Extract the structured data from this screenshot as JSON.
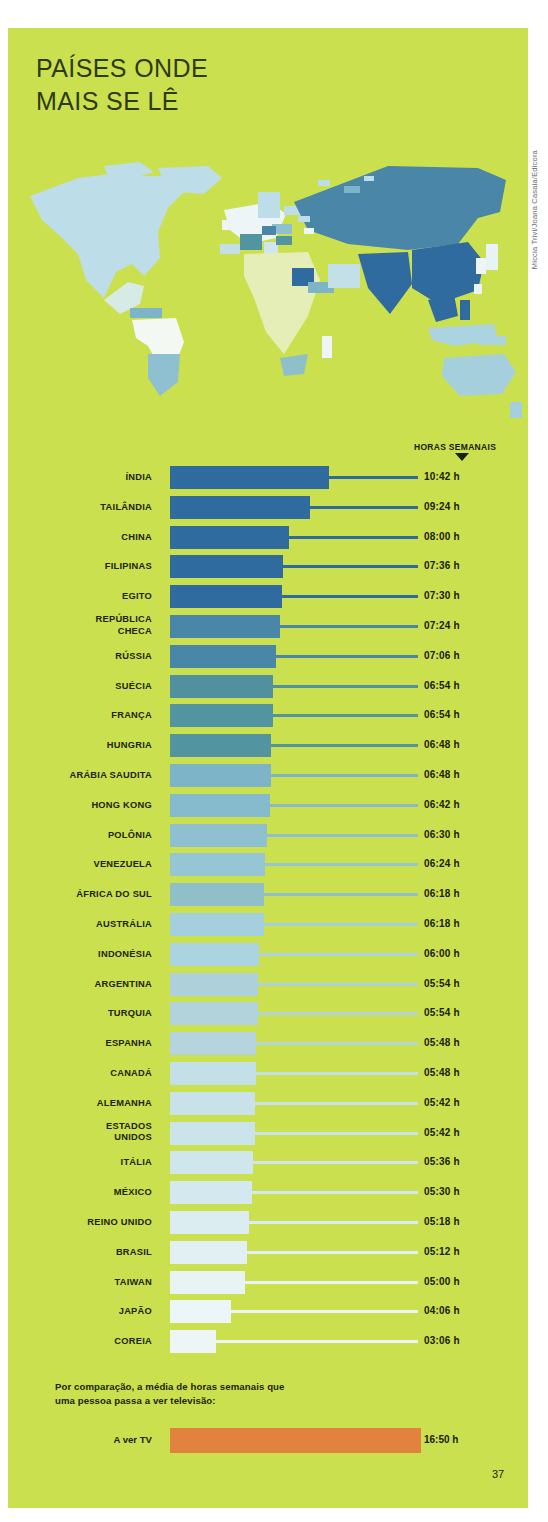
{
  "title": {
    "line1": "PAÍSES ONDE",
    "line2": "MAIS SE LÊ"
  },
  "header": {
    "column_label": "HORAS SEMANAIS",
    "marker_icon": "down-triangle-icon"
  },
  "footnote": {
    "line1": "Por comparação, a média de horas semanais que",
    "line2": "uma pessoa passa a ver televisão:"
  },
  "tv": {
    "label": "A ver TV",
    "value": "16:50 h"
  },
  "page_number": "37",
  "credit": "Miccia Trivi/Joana Casaia/Edicora",
  "colors": {
    "background": "#cbe04f",
    "text": "#1b2409",
    "tv_bar": "#e2823f",
    "darkest_bar": "#2f6b9e",
    "lightest_bar": "#eef5f6"
  },
  "chart_data": {
    "type": "bar",
    "title": "PAÍSES ONDE MAIS SE LÊ",
    "subtitle": "",
    "xlabel": "",
    "ylabel": "",
    "value_axis_label": "HORAS SEMANAIS",
    "orientation": "horizontal",
    "grid": false,
    "legend": "none",
    "unit": "h",
    "xlim": [
      0,
      11
    ],
    "categories": [
      "ÍNDIA",
      "TAILÂNDIA",
      "CHINA",
      "FILIPINAS",
      "EGITO",
      "REPÚBLICA\nCHECA",
      "RÚSSIA",
      "SUÉCIA",
      "FRANÇA",
      "HUNGRIA",
      "ARÁBIA SAUDITA",
      "HONG KONG",
      "POLÔNIA",
      "VENEZUELA",
      "ÁFRICA DO SUL",
      "AUSTRÁLIA",
      "INDONÉSIA",
      "ARGENTINA",
      "TURQUIA",
      "ESPANHA",
      "CANADÁ",
      "ALEMANHA",
      "ESTADOS\nUNIDOS",
      "ITÁLIA",
      "MÉXICO",
      "REINO UNIDO",
      "BRASIL",
      "TAIWAN",
      "JAPÃO",
      "COREIA"
    ],
    "labels": [
      "10:42 h",
      "09:24 h",
      "08:00 h",
      "07:36 h",
      "07:30 h",
      "07:24 h",
      "07:06 h",
      "06:54 h",
      "06:54 h",
      "06:48 h",
      "06:48 h",
      "06:42 h",
      "06:30 h",
      "06:24 h",
      "06:18 h",
      "06:18 h",
      "06:00 h",
      "05:54 h",
      "05:54 h",
      "05:48 h",
      "05:48 h",
      "05:42 h",
      "05:42 h",
      "05:36 h",
      "05:30 h",
      "05:18 h",
      "05:12 h",
      "05:00 h",
      "04:06 h",
      "03:06 h"
    ],
    "values": [
      10.7,
      9.4,
      8.0,
      7.6,
      7.5,
      7.4,
      7.1,
      6.9,
      6.9,
      6.8,
      6.8,
      6.7,
      6.5,
      6.4,
      6.3,
      6.3,
      6.0,
      5.9,
      5.9,
      5.8,
      5.8,
      5.7,
      5.7,
      5.6,
      5.5,
      5.3,
      5.2,
      5.0,
      4.1,
      3.1
    ],
    "bar_colors": [
      "#2f6b9e",
      "#2f6b9e",
      "#2f6b9e",
      "#2f6b9e",
      "#2f6b9e",
      "#4a86a8",
      "#4a86a8",
      "#50909f",
      "#52949f",
      "#52949f",
      "#7eb4c8",
      "#86bbcd",
      "#8ec0d1",
      "#96c5d4",
      "#8fbfc8",
      "#a6cfdd",
      "#abd3e0",
      "#aed0da",
      "#b2d2dc",
      "#b6d4dd",
      "#c3dfe8",
      "#c9e2ea",
      "#cbe3eb",
      "#cfe6ed",
      "#d4e9ef",
      "#dcedf2",
      "#e2f0f4",
      "#e8f3f6",
      "#ecf5f7",
      "#eef5f6"
    ],
    "comparison": {
      "label": "A ver TV",
      "value": 16.83,
      "display": "16:50 h",
      "color": "#e2823f"
    }
  }
}
